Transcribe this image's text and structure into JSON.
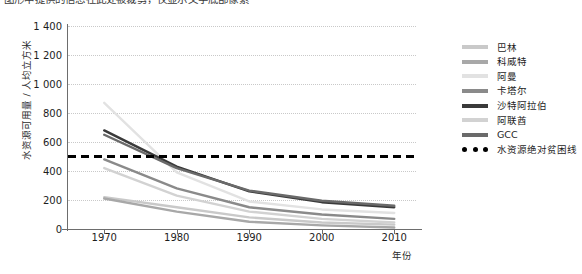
{
  "caption": "图形中提供的信息在此处被裁剪，仅显示文字底部像素",
  "axes": {
    "ylabel": "水资源可用量 / 人均立方米",
    "xlabel": "年份",
    "yticks": [
      "1 400",
      "1 200",
      "1 000",
      "800",
      "600",
      "400",
      "200",
      "0"
    ],
    "xticks": [
      "1970",
      "1980",
      "1990",
      "2000",
      "2010"
    ]
  },
  "legend": [
    {
      "label": "巴林",
      "color": "#c9c9c9",
      "style": "solid"
    },
    {
      "label": "科威特",
      "color": "#a8a8a8",
      "style": "solid"
    },
    {
      "label": "阿曼",
      "color": "#e2e2e2",
      "style": "solid"
    },
    {
      "label": "卡塔尔",
      "color": "#8a8a8a",
      "style": "solid"
    },
    {
      "label": "沙特阿拉伯",
      "color": "#3a3a3a",
      "style": "solid"
    },
    {
      "label": "阿联酋",
      "color": "#d2d2d2",
      "style": "solid"
    },
    {
      "label": "GCC",
      "color": "#6a6a6a",
      "style": "solid"
    },
    {
      "label": "水资源绝对贫困线",
      "color": "#000000",
      "style": "dotted"
    }
  ],
  "chart_data": {
    "type": "line",
    "title": "",
    "xlabel": "年份",
    "ylabel": "水资源可用量 / 人均立方米",
    "x": [
      1970,
      1980,
      1990,
      2000,
      2010
    ],
    "xlim": [
      1965,
      2013
    ],
    "ylim": [
      0,
      1400
    ],
    "ytick_values": [
      0,
      200,
      400,
      600,
      800,
      1000,
      1200,
      1400
    ],
    "grid": true,
    "legend_position": "right",
    "series": [
      {
        "name": "巴林",
        "color": "#c9c9c9",
        "values": [
          220,
          150,
          80,
          45,
          30
        ]
      },
      {
        "name": "科威特",
        "color": "#a8a8a8",
        "values": [
          210,
          120,
          50,
          25,
          10
        ]
      },
      {
        "name": "阿曼",
        "color": "#e2e2e2",
        "values": [
          870,
          390,
          190,
          135,
          110
        ]
      },
      {
        "name": "卡塔尔",
        "color": "#8a8a8a",
        "values": [
          480,
          280,
          150,
          100,
          70
        ]
      },
      {
        "name": "沙特阿拉伯",
        "color": "#3a3a3a",
        "values": [
          680,
          430,
          260,
          185,
          150
        ]
      },
      {
        "name": "阿联酋",
        "color": "#d2d2d2",
        "values": [
          420,
          230,
          120,
          70,
          45
        ]
      },
      {
        "name": "GCC",
        "color": "#6a6a6a",
        "values": [
          650,
          420,
          265,
          195,
          160
        ]
      }
    ],
    "reference_lines": [
      {
        "name": "水资源绝对贫困线",
        "value": 500,
        "color": "#000000",
        "style": "dashed"
      }
    ]
  }
}
